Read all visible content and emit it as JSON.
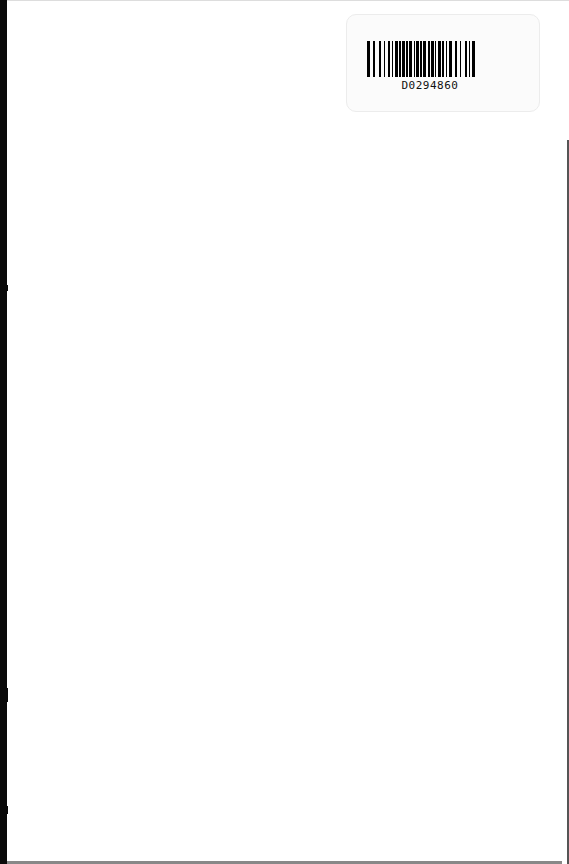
{
  "document": {
    "type": "scanned blank page",
    "barcode_label": {
      "text": "D0294860"
    }
  }
}
